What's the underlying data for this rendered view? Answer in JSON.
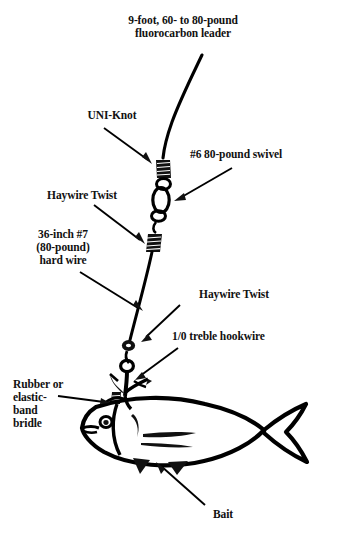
{
  "diagram": {
    "ink_color": "#000000",
    "background_color": "#ffffff"
  },
  "labels": {
    "leader": "9-foot, 60- to 80-pound\nfluorocarbon leader",
    "uni_knot": "UNI-Knot",
    "swivel": "#6 80-pound swivel",
    "haywire_twist_upper": "Haywire Twist",
    "hard_wire": "36-inch #7\n(80-pound)\nhard wire",
    "haywire_twist_lower": "Haywire Twist",
    "hookwire": "1/0 treble hookwire",
    "bridle": "Rubber or\nelastic-\nband\nbridle",
    "bait": "Bait"
  },
  "parts": {
    "leader_line": "fluorocarbon-leader-line",
    "knot": "uni-knot-coil",
    "swivel_body": "barrel-swivel",
    "twist_upper": "haywire-twist-upper",
    "wire": "hard-wire-segment",
    "twist_lower": "haywire-twist-lower",
    "hook": "treble-hook",
    "bridle_band": "rubber-band-bridle",
    "baitfish": "bait-fish"
  }
}
